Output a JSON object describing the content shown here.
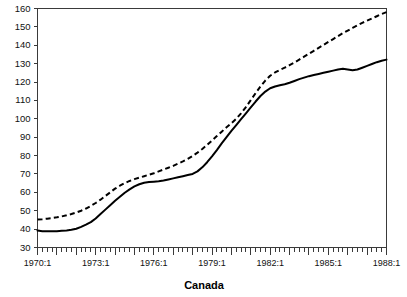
{
  "chart_data": {
    "type": "line",
    "title": "",
    "subtitle": "",
    "xlabel": "Canada",
    "ylabel": "",
    "ylim": [
      30,
      160
    ],
    "xlim": [
      "1970:1",
      "1988:1"
    ],
    "grid": false,
    "legend": "none",
    "y_ticks": [
      30,
      40,
      50,
      60,
      70,
      80,
      90,
      100,
      110,
      120,
      130,
      140,
      150,
      160
    ],
    "y_tick_labels": [
      "30",
      "40",
      "50",
      "60",
      "70",
      "80",
      "90",
      "100",
      "110",
      "120",
      "130",
      "140",
      "150",
      "160"
    ],
    "x_tick_labels": [
      "1970:1",
      "1973:1",
      "1976:1",
      "1979:1",
      "1982:1",
      "1985:1",
      "1988:1"
    ],
    "x_tick_quarter_index": [
      0,
      12,
      24,
      36,
      48,
      60,
      72
    ],
    "x_minor_tick_interval": "quarter",
    "x_major_tick_interval": "year",
    "n_points": 73,
    "x": [
      "1970:1",
      "1970:2",
      "1970:3",
      "1970:4",
      "1971:1",
      "1971:2",
      "1971:3",
      "1971:4",
      "1972:1",
      "1972:2",
      "1972:3",
      "1972:4",
      "1973:1",
      "1973:2",
      "1973:3",
      "1973:4",
      "1974:1",
      "1974:2",
      "1974:3",
      "1974:4",
      "1975:1",
      "1975:2",
      "1975:3",
      "1975:4",
      "1976:1",
      "1976:2",
      "1976:3",
      "1976:4",
      "1977:1",
      "1977:2",
      "1977:3",
      "1977:4",
      "1978:1",
      "1978:2",
      "1978:3",
      "1978:4",
      "1979:1",
      "1979:2",
      "1979:3",
      "1979:4",
      "1980:1",
      "1980:2",
      "1980:3",
      "1980:4",
      "1981:1",
      "1981:2",
      "1981:3",
      "1981:4",
      "1982:1",
      "1982:2",
      "1982:3",
      "1982:4",
      "1983:1",
      "1983:2",
      "1983:3",
      "1983:4",
      "1984:1",
      "1984:2",
      "1984:3",
      "1984:4",
      "1985:1",
      "1985:2",
      "1985:3",
      "1985:4",
      "1986:1",
      "1986:2",
      "1986:3",
      "1986:4",
      "1987:1",
      "1987:2",
      "1987:3",
      "1987:4",
      "1988:1"
    ],
    "series": [
      {
        "name": "solid-series",
        "style": "solid",
        "color": "#000000",
        "values": [
          39.2,
          38.9,
          38.8,
          38.8,
          38.9,
          39.1,
          39.3,
          39.6,
          40.2,
          41.2,
          42.4,
          43.8,
          45.8,
          48.2,
          50.6,
          53.0,
          55.4,
          57.6,
          59.8,
          61.6,
          63.2,
          64.4,
          65.2,
          65.6,
          65.8,
          66.0,
          66.4,
          67.0,
          67.6,
          68.2,
          68.8,
          69.4,
          70.0,
          71.4,
          73.6,
          76.4,
          79.6,
          83.0,
          86.6,
          90.0,
          93.4,
          96.6,
          99.8,
          103.0,
          106.2,
          109.4,
          112.4,
          114.8,
          116.6,
          117.6,
          118.2,
          118.8,
          119.6,
          120.6,
          121.6,
          122.4,
          123.2,
          123.8,
          124.4,
          125.0,
          125.6,
          126.2,
          126.8,
          127.2,
          126.8,
          126.4,
          126.8,
          127.8,
          128.8,
          129.8,
          130.8,
          131.6,
          132.2
        ]
      },
      {
        "name": "dashed-series",
        "style": "dashed",
        "color": "#000000",
        "values": [
          45.2,
          45.4,
          45.7,
          46.0,
          46.4,
          46.9,
          47.5,
          48.2,
          49.0,
          50.0,
          51.2,
          52.6,
          54.2,
          56.0,
          58.0,
          60.0,
          62.0,
          63.6,
          65.0,
          66.2,
          67.2,
          68.0,
          68.8,
          69.6,
          70.4,
          71.4,
          72.4,
          73.4,
          74.4,
          75.6,
          76.8,
          78.2,
          79.8,
          81.6,
          83.6,
          85.8,
          88.2,
          90.6,
          93.0,
          95.4,
          97.6,
          100.0,
          103.0,
          106.4,
          110.2,
          114.0,
          117.6,
          120.8,
          123.4,
          125.2,
          126.6,
          127.8,
          129.2,
          130.6,
          132.2,
          133.8,
          135.4,
          137.0,
          138.6,
          140.2,
          141.8,
          143.4,
          145.0,
          146.6,
          148.0,
          149.4,
          150.8,
          152.2,
          153.4,
          154.6,
          155.8,
          157.0,
          158.0
        ]
      }
    ]
  }
}
